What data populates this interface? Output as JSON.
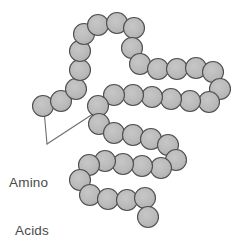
{
  "figure": {
    "background_color": "#ffffff"
  },
  "label": {
    "name": "amino-acids-label",
    "line_1": "Amino",
    "line_2": "Acids",
    "text_color": "#4a4a4a",
    "font_size_px": 13.5
  },
  "style": {
    "bead_fill": "#b9b9b9",
    "bead_stroke": "#4f4f4f",
    "bead_radius_px": 10.5,
    "leader_stroke": "#6e6e6e"
  },
  "leaders": [
    {
      "name": "leader-to-first-bead",
      "from_x": 47,
      "from_y": 144,
      "to_x": 44,
      "to_y": 110
    },
    {
      "name": "leader-to-mid-bead",
      "from_x": 47,
      "from_y": 144,
      "to_x": 99,
      "to_y": 110
    }
  ],
  "chain": {
    "name": "polypeptide-chain",
    "bead_count": 44,
    "beads": [
      {
        "i": 1,
        "x": 43,
        "y": 106
      },
      {
        "i": 2,
        "x": 61,
        "y": 101
      },
      {
        "i": 3,
        "x": 76,
        "y": 89
      },
      {
        "i": 4,
        "x": 80,
        "y": 70
      },
      {
        "i": 5,
        "x": 80,
        "y": 51
      },
      {
        "i": 6,
        "x": 84,
        "y": 34
      },
      {
        "i": 7,
        "x": 98,
        "y": 25
      },
      {
        "i": 8,
        "x": 117,
        "y": 23
      },
      {
        "i": 9,
        "x": 134,
        "y": 28
      },
      {
        "i": 10,
        "x": 132,
        "y": 48
      },
      {
        "i": 11,
        "x": 140,
        "y": 64
      },
      {
        "i": 12,
        "x": 158,
        "y": 69
      },
      {
        "i": 13,
        "x": 177,
        "y": 69
      },
      {
        "i": 14,
        "x": 196,
        "y": 68
      },
      {
        "i": 15,
        "x": 213,
        "y": 72
      },
      {
        "i": 16,
        "x": 220,
        "y": 89
      },
      {
        "i": 17,
        "x": 209,
        "y": 102
      },
      {
        "i": 18,
        "x": 190,
        "y": 101
      },
      {
        "i": 19,
        "x": 171,
        "y": 99
      },
      {
        "i": 20,
        "x": 152,
        "y": 97
      },
      {
        "i": 21,
        "x": 133,
        "y": 95
      },
      {
        "i": 22,
        "x": 114,
        "y": 95
      },
      {
        "i": 23,
        "x": 98,
        "y": 106
      },
      {
        "i": 24,
        "x": 99,
        "y": 124
      },
      {
        "i": 25,
        "x": 114,
        "y": 133
      },
      {
        "i": 26,
        "x": 133,
        "y": 135
      },
      {
        "i": 27,
        "x": 151,
        "y": 139
      },
      {
        "i": 28,
        "x": 168,
        "y": 145
      },
      {
        "i": 29,
        "x": 176,
        "y": 160
      },
      {
        "i": 30,
        "x": 161,
        "y": 168
      },
      {
        "i": 31,
        "x": 142,
        "y": 166
      },
      {
        "i": 32,
        "x": 123,
        "y": 164
      },
      {
        "i": 33,
        "x": 105,
        "y": 161
      },
      {
        "i": 34,
        "x": 89,
        "y": 165
      },
      {
        "i": 35,
        "x": 80,
        "y": 180
      },
      {
        "i": 36,
        "x": 90,
        "y": 195
      },
      {
        "i": 37,
        "x": 108,
        "y": 199
      },
      {
        "i": 38,
        "x": 127,
        "y": 200
      },
      {
        "i": 39,
        "x": 145,
        "y": 198
      },
      {
        "i": 40,
        "x": 148,
        "y": 217
      }
    ],
    "links": [
      [
        1,
        2
      ],
      [
        2,
        3
      ],
      [
        3,
        4
      ],
      [
        4,
        5
      ],
      [
        5,
        6
      ],
      [
        6,
        7
      ],
      [
        7,
        8
      ],
      [
        8,
        9
      ],
      [
        9,
        10
      ],
      [
        10,
        11
      ],
      [
        11,
        12
      ],
      [
        12,
        13
      ],
      [
        13,
        14
      ],
      [
        14,
        15
      ],
      [
        15,
        16
      ],
      [
        16,
        17
      ],
      [
        17,
        18
      ],
      [
        18,
        19
      ],
      [
        19,
        20
      ],
      [
        20,
        21
      ],
      [
        21,
        22
      ],
      [
        22,
        23
      ],
      [
        23,
        24
      ],
      [
        24,
        25
      ],
      [
        25,
        26
      ],
      [
        26,
        27
      ],
      [
        27,
        28
      ],
      [
        28,
        29
      ],
      [
        29,
        30
      ],
      [
        30,
        31
      ],
      [
        31,
        32
      ],
      [
        32,
        33
      ],
      [
        33,
        34
      ],
      [
        34,
        35
      ],
      [
        35,
        36
      ],
      [
        36,
        37
      ],
      [
        37,
        38
      ],
      [
        38,
        39
      ],
      [
        39,
        40
      ]
    ]
  }
}
